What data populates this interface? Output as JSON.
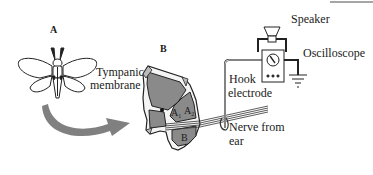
{
  "panels": {
    "a_label": "A",
    "b_label": "B"
  },
  "labels": {
    "tympanic_line1": "Tympanic",
    "tympanic_line2": "membrane",
    "speaker": "Speaker",
    "oscilloscope": "Oscilloscope",
    "hook_line1": "Hook",
    "hook_line2": "electrode",
    "nerve_line1": "Nerve from",
    "nerve_line2": "ear",
    "a1": "A",
    "a1_sub": "1",
    "a2": "A",
    "a2_sub": "2",
    "b_region": "B"
  },
  "colors": {
    "tissue_fill": "#8a8a8a",
    "arrow_fill": "#808080",
    "line": "#333333",
    "background": "#ffffff"
  }
}
